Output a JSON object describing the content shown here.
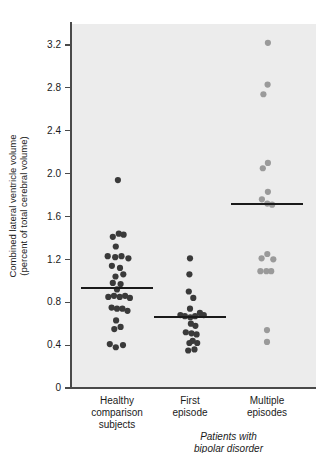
{
  "chart_data": {
    "type": "scatter",
    "title": "",
    "xlabel": "",
    "ylabel": "Combined lateral ventricle volume (percent of total cerebral volume)",
    "ylabel_line1": "Combined lateral ventricle volume",
    "ylabel_line2": "(percent of total cerebral volume)",
    "ylim": [
      0,
      3.4
    ],
    "yticks": [
      0,
      0.4,
      0.8,
      1.2,
      1.6,
      2.0,
      2.4,
      2.8,
      3.2
    ],
    "ytick_labels": [
      "0",
      "0.4",
      "0.8",
      "1.2",
      "1.6",
      "2.0",
      "2.4",
      "2.8",
      "3.2"
    ],
    "grid": false,
    "legend": "none",
    "bracket_label_line1": "Patients with",
    "bracket_label_line2": "bipolar disorder",
    "bracket_groups": [
      "First episode",
      "Multiple episodes"
    ],
    "plot_background": "#ececec",
    "categories": [
      "Healthy comparison subjects",
      "First episode",
      "Multiple episodes"
    ],
    "category_label_lines": [
      [
        "Healthy",
        "comparison",
        "subjects"
      ],
      [
        "First",
        "episode"
      ],
      [
        "Multiple",
        "episodes"
      ]
    ],
    "series": [
      {
        "name": "Healthy comparison subjects",
        "n": 31,
        "color": "#3a3a3a",
        "median": 0.93,
        "median_label": "0.93",
        "points": [
          {
            "x_offset": 0.03,
            "y": 1.94
          },
          {
            "x_offset": -0.14,
            "y": 1.41
          },
          {
            "x_offset": 0.06,
            "y": 1.44
          },
          {
            "x_offset": 0.22,
            "y": 1.43
          },
          {
            "x_offset": -0.04,
            "y": 1.32
          },
          {
            "x_offset": -0.31,
            "y": 1.23
          },
          {
            "x_offset": -0.06,
            "y": 1.22
          },
          {
            "x_offset": 0.15,
            "y": 1.23
          },
          {
            "x_offset": 0.38,
            "y": 1.21
          },
          {
            "x_offset": -0.17,
            "y": 1.14
          },
          {
            "x_offset": 0.1,
            "y": 1.12
          },
          {
            "x_offset": -0.05,
            "y": 1.04
          },
          {
            "x_offset": 0.21,
            "y": 1.06
          },
          {
            "x_offset": -0.14,
            "y": 0.98
          },
          {
            "x_offset": 0.12,
            "y": 0.97
          },
          {
            "x_offset": 0.0,
            "y": 0.92
          },
          {
            "x_offset": -0.29,
            "y": 0.85
          },
          {
            "x_offset": -0.1,
            "y": 0.86
          },
          {
            "x_offset": 0.09,
            "y": 0.85
          },
          {
            "x_offset": 0.27,
            "y": 0.86
          },
          {
            "x_offset": 0.43,
            "y": 0.84
          },
          {
            "x_offset": -0.18,
            "y": 0.75
          },
          {
            "x_offset": 0.0,
            "y": 0.74
          },
          {
            "x_offset": 0.18,
            "y": 0.74
          },
          {
            "x_offset": 0.35,
            "y": 0.72
          },
          {
            "x_offset": -0.03,
            "y": 0.63
          },
          {
            "x_offset": 0.12,
            "y": 0.57
          },
          {
            "x_offset": -0.09,
            "y": 0.55
          },
          {
            "x_offset": -0.24,
            "y": 0.41
          },
          {
            "x_offset": -0.04,
            "y": 0.38
          },
          {
            "x_offset": 0.2,
            "y": 0.4
          }
        ]
      },
      {
        "name": "First episode",
        "n": 21,
        "color": "#3a3a3a",
        "median": 0.66,
        "median_label": "0.66",
        "points": [
          {
            "x_offset": 0.0,
            "y": 1.21
          },
          {
            "x_offset": -0.02,
            "y": 1.06
          },
          {
            "x_offset": -0.04,
            "y": 0.9
          },
          {
            "x_offset": 0.11,
            "y": 0.84
          },
          {
            "x_offset": 0.0,
            "y": 0.74
          },
          {
            "x_offset": -0.32,
            "y": 0.68
          },
          {
            "x_offset": -0.17,
            "y": 0.67
          },
          {
            "x_offset": 0.01,
            "y": 0.66
          },
          {
            "x_offset": 0.17,
            "y": 0.67
          },
          {
            "x_offset": 0.33,
            "y": 0.7
          },
          {
            "x_offset": 0.46,
            "y": 0.68
          },
          {
            "x_offset": 0.03,
            "y": 0.6
          },
          {
            "x_offset": 0.18,
            "y": 0.58
          },
          {
            "x_offset": -0.14,
            "y": 0.52
          },
          {
            "x_offset": 0.05,
            "y": 0.51
          },
          {
            "x_offset": 0.22,
            "y": 0.5
          },
          {
            "x_offset": 0.09,
            "y": 0.44
          },
          {
            "x_offset": -0.02,
            "y": 0.42
          },
          {
            "x_offset": 0.24,
            "y": 0.42
          },
          {
            "x_offset": 0.15,
            "y": 0.36
          },
          {
            "x_offset": -0.06,
            "y": 0.35
          }
        ]
      },
      {
        "name": "Multiple episodes",
        "n": 15,
        "color": "#9a9a9a",
        "median": 1.72,
        "median_label": "1.72",
        "points": [
          {
            "x_offset": 0.03,
            "y": 3.22
          },
          {
            "x_offset": 0.02,
            "y": 2.83
          },
          {
            "x_offset": -0.12,
            "y": 2.74
          },
          {
            "x_offset": 0.03,
            "y": 2.1
          },
          {
            "x_offset": -0.14,
            "y": 2.05
          },
          {
            "x_offset": 0.03,
            "y": 1.83
          },
          {
            "x_offset": -0.17,
            "y": 1.76
          },
          {
            "x_offset": 0.01,
            "y": 1.72
          },
          {
            "x_offset": 0.17,
            "y": 1.71
          },
          {
            "x_offset": -0.18,
            "y": 1.21
          },
          {
            "x_offset": 0.01,
            "y": 1.25
          },
          {
            "x_offset": 0.21,
            "y": 1.2
          },
          {
            "x_offset": -0.22,
            "y": 1.09
          },
          {
            "x_offset": -0.02,
            "y": 1.09
          },
          {
            "x_offset": 0.14,
            "y": 1.09
          },
          {
            "x_offset": 0.0,
            "y": 0.54
          },
          {
            "x_offset": 0.0,
            "y": 0.43
          }
        ]
      }
    ],
    "geometry": {
      "plot_left": 71,
      "plot_right": 316,
      "plot_top": 24,
      "plot_bottom": 388,
      "y_zero_px": 388,
      "px_per_unit": 107.2,
      "group_centers_px": [
        117,
        190,
        267
      ],
      "group_spread_px": 30,
      "median_half_width_px": 36,
      "dot_radius": 3.1
    }
  }
}
